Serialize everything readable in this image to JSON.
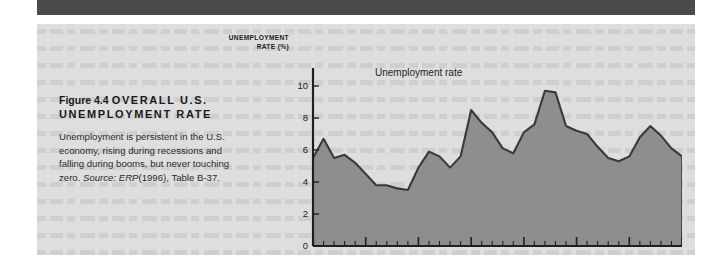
{
  "page": {
    "background_color": "#ffffff",
    "top_band_color": "#4b4b4b",
    "panel_color": "#dedede"
  },
  "caption": {
    "figure_number": "Figure 4.4",
    "headline": "OVERALL U.S. UNEMPLOYMENT RATE",
    "headline_line1": "OVERALL U.S.",
    "headline_line2": "UNEMPLOYMENT RATE",
    "body": "Unemployment is persistent in the U.S. economy, rising during recessions and falling during booms, but never touching zero.",
    "source_label": "Source:",
    "source_work": "ERP",
    "source_detail": "(1996), Table B-37."
  },
  "chart_data": {
    "type": "area",
    "title": "Figure 4.4 OVERALL U.S. UNEMPLOYMENT RATE",
    "xlabel": "",
    "ylabel": "UNEMPLOYMENT RATE (%)",
    "ylabel_line1": "UNEMPLOYMENT",
    "ylabel_line2": "RATE (%)",
    "xlim": [
      1960,
      1995
    ],
    "ylim": [
      0,
      10
    ],
    "yticks": [
      0,
      2,
      4,
      6,
      8,
      10
    ],
    "ytick_labels": [
      "0",
      "2",
      "4",
      "6",
      "8",
      "10"
    ],
    "xticks": [
      1960,
      1965,
      1970,
      1975,
      1980,
      1985,
      1990,
      1995
    ],
    "xtick_labels": [
      "1960",
      "1965",
      "1970",
      "1975",
      "1980",
      "1985",
      "1990",
      "1995"
    ],
    "minor_xtick_interval": 1,
    "grid": false,
    "legend_position": "inline-annotation",
    "annotation": "Unemployment rate",
    "fill_color": "#8e8e8e",
    "line_color": "#3a3a3a",
    "series": [
      {
        "name": "Unemployment rate",
        "x": [
          1960,
          1961,
          1962,
          1963,
          1964,
          1965,
          1966,
          1967,
          1968,
          1969,
          1970,
          1971,
          1972,
          1973,
          1974,
          1975,
          1976,
          1977,
          1978,
          1979,
          1980,
          1981,
          1982,
          1983,
          1984,
          1985,
          1986,
          1987,
          1988,
          1989,
          1990,
          1991,
          1992,
          1993,
          1994,
          1995
        ],
        "values": [
          5.5,
          6.7,
          5.5,
          5.7,
          5.2,
          4.5,
          3.8,
          3.8,
          3.6,
          3.5,
          4.9,
          5.9,
          5.6,
          4.9,
          5.6,
          8.5,
          7.7,
          7.1,
          6.1,
          5.8,
          7.1,
          7.6,
          9.7,
          9.6,
          7.5,
          7.2,
          7.0,
          6.2,
          5.5,
          5.3,
          5.6,
          6.8,
          7.5,
          6.9,
          6.1,
          5.6
        ],
        "units": "percent"
      }
    ]
  }
}
